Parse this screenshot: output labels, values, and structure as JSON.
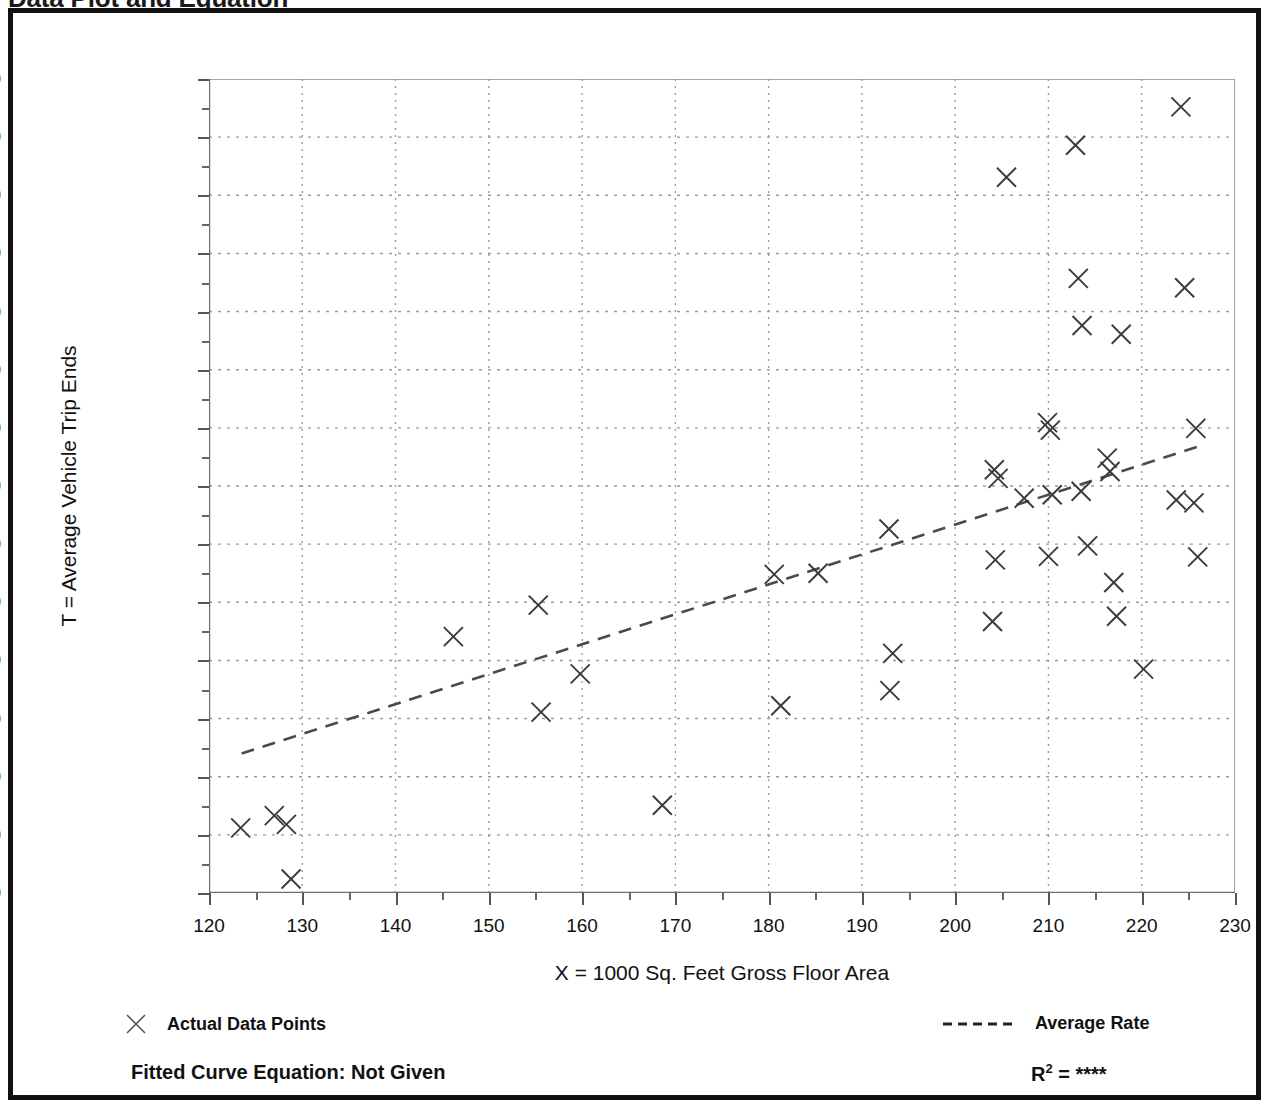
{
  "page": {
    "title": "Data Plot and Equation",
    "background_color": "#ffffff",
    "frame_color": "#111111"
  },
  "footer": {
    "equation_label": "Fitted Curve Equation:  Not Given",
    "r2_prefix": "R",
    "r2_exponent": "2",
    "r2_equals": " = ",
    "r2_value": "****"
  },
  "legend": {
    "items": [
      {
        "label": "Actual Data Points",
        "marker": "x-marker-icon"
      },
      {
        "label": "Average Rate",
        "marker": "dashed-line-icon"
      }
    ]
  },
  "chart_data": {
    "type": "scatter",
    "title": "Data Plot and Equation",
    "xlabel": "X = 1000 Sq. Feet Gross Floor Area",
    "ylabel": "T = Average Vehicle Trip Ends",
    "xlim": [
      120,
      230
    ],
    "ylim": [
      400,
      1800
    ],
    "xticks": [
      120,
      130,
      140,
      150,
      160,
      170,
      180,
      190,
      200,
      210,
      220,
      230
    ],
    "xtick_labels": [
      "120",
      "130",
      "140",
      "150",
      "160",
      "170",
      "180",
      "190",
      "200",
      "210",
      "220",
      "230"
    ],
    "xtick_minor_step": 5,
    "yticks": [
      400,
      500,
      600,
      700,
      800,
      900,
      1000,
      1100,
      1200,
      1300,
      1400,
      1500,
      1600,
      1700,
      1800
    ],
    "ytick_labels": [
      "400",
      "500",
      "600",
      "700",
      "800",
      "900",
      "1,000",
      "1,100",
      "1,200",
      "1,300",
      "1,400",
      "1,500",
      "1,600",
      "1,700",
      "1,800"
    ],
    "ytick_minor_step": 50,
    "grid": true,
    "grid_style": "dotted",
    "grid_color": "#9a9a9a",
    "legend_position": "below-plot",
    "marker_color": "#3a3a3a",
    "line_color": "#4a4a4a",
    "series": [
      {
        "name": "Actual Data Points",
        "marker": "x",
        "points": [
          [
            123.4,
            512
          ],
          [
            127.0,
            533
          ],
          [
            128.3,
            518
          ],
          [
            128.8,
            424
          ],
          [
            146.2,
            841
          ],
          [
            155.3,
            895
          ],
          [
            155.6,
            711
          ],
          [
            159.8,
            777
          ],
          [
            168.6,
            551
          ],
          [
            180.6,
            948
          ],
          [
            181.3,
            722
          ],
          [
            185.3,
            950
          ],
          [
            192.9,
            1026
          ],
          [
            193.3,
            812
          ],
          [
            193.0,
            748
          ],
          [
            204.2,
            1128
          ],
          [
            204.6,
            1113
          ],
          [
            204.3,
            973
          ],
          [
            204.0,
            867
          ],
          [
            205.5,
            1631
          ],
          [
            207.4,
            1079
          ],
          [
            209.9,
            1209
          ],
          [
            210.2,
            1196
          ],
          [
            210.4,
            1085
          ],
          [
            210.0,
            979
          ],
          [
            212.9,
            1686
          ],
          [
            213.2,
            1457
          ],
          [
            213.6,
            1376
          ],
          [
            213.5,
            1091
          ],
          [
            214.2,
            997
          ],
          [
            216.3,
            1148
          ],
          [
            216.6,
            1125
          ],
          [
            217.0,
            934
          ],
          [
            217.3,
            876
          ],
          [
            217.8,
            1361
          ],
          [
            220.2,
            785
          ],
          [
            223.7,
            1076
          ],
          [
            224.2,
            1752
          ],
          [
            224.6,
            1441
          ],
          [
            225.6,
            1071
          ],
          [
            225.8,
            1199
          ],
          [
            226.0,
            978
          ]
        ]
      }
    ],
    "trendline": {
      "name": "Average Rate",
      "style": "dashed",
      "start": [
        123.5,
        640
      ],
      "end": [
        226.5,
        1170
      ]
    }
  }
}
